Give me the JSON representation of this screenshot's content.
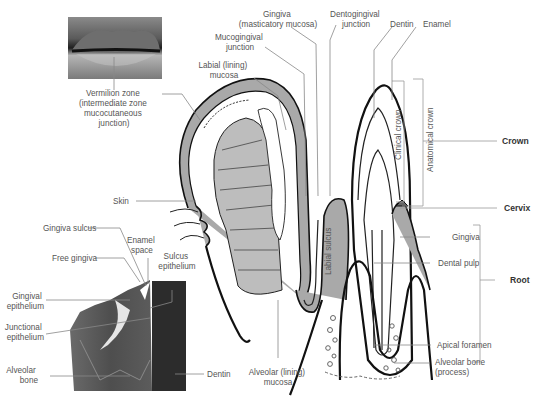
{
  "colors": {
    "background": "#ffffff",
    "outline": "#111111",
    "tissue_gray": "#a9a9a9",
    "muscle_gray": "#bdbdbd",
    "label_text": "#555555",
    "bold_label_text": "#333333",
    "leader_line": "#888888",
    "histology_dark": "#3a3a3a"
  },
  "labels": {
    "vermilion_zone": [
      "Vermilion zone",
      "(intermediate zone",
      "mucocutaneous",
      "junction)"
    ],
    "gingiva_masticatory": [
      "Gingiva",
      "(masticatory mucosa)"
    ],
    "mucogingival_junction": [
      "Mucogingival",
      "junction"
    ],
    "labial_lining_mucosa": [
      "Labial (lining)",
      "mucosa"
    ],
    "dentogingival_junction": [
      "Dentogingival",
      "junction"
    ],
    "dentin_top": "Dentin",
    "enamel": "Enamel",
    "clinical_crown": "Clinical crown",
    "anatomical_crown": "Anatomical crown",
    "crown": "Crown",
    "cervix": "Cervix",
    "root": "Root",
    "gingiva_right": "Gingiva",
    "dental_pulp": "Dental pulp",
    "apical_foramen": "Apical foramen",
    "alveolar_bone_process": [
      "Alveolar bone",
      "(process)"
    ],
    "alveolar_lining_mucosa": [
      "Alveolar (lining)",
      "mucosa"
    ],
    "labial_sulcus": "Labial sulcus",
    "skin": "Skin",
    "gingiva_sulcus": "Gingiva sulcus",
    "enamel_space": [
      "Enamel",
      "space"
    ],
    "free_gingiva": "Free gingiva",
    "sulcus_epithelium": [
      "Sulcus",
      "epithelium"
    ],
    "gingival_epithelium": [
      "Gingival",
      "epithelium"
    ],
    "junctional_epithelium": [
      "Junctional",
      "epithelium"
    ],
    "alveolar_bone_left": [
      "Alveolar",
      "bone"
    ],
    "dentin_histology": "Dentin"
  },
  "images": {
    "lips_photo": "lips-photo",
    "histology_photo": "gingiva-histology-micrograph"
  }
}
